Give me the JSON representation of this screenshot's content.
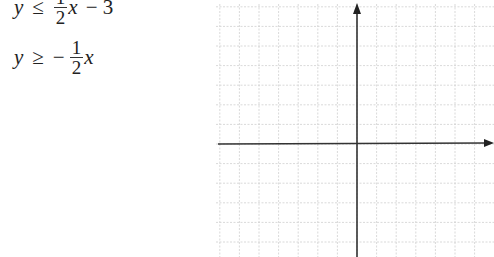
{
  "inequalities": [
    {
      "lhs": "y",
      "op": "≤",
      "sign": "",
      "num": "1",
      "den": "2",
      "var": "x",
      "tail": "− 3"
    },
    {
      "lhs": "y",
      "op": "≥",
      "sign": "−",
      "num": "1",
      "den": "2",
      "var": "x",
      "tail": ""
    }
  ],
  "graph": {
    "x_axis_label": "x",
    "y_axis_label": "y",
    "origin_px": [
      357,
      144
    ],
    "grid_spacing_px": 19.6,
    "grid_color": "#c8c8c8",
    "axis_color": "#333333"
  }
}
